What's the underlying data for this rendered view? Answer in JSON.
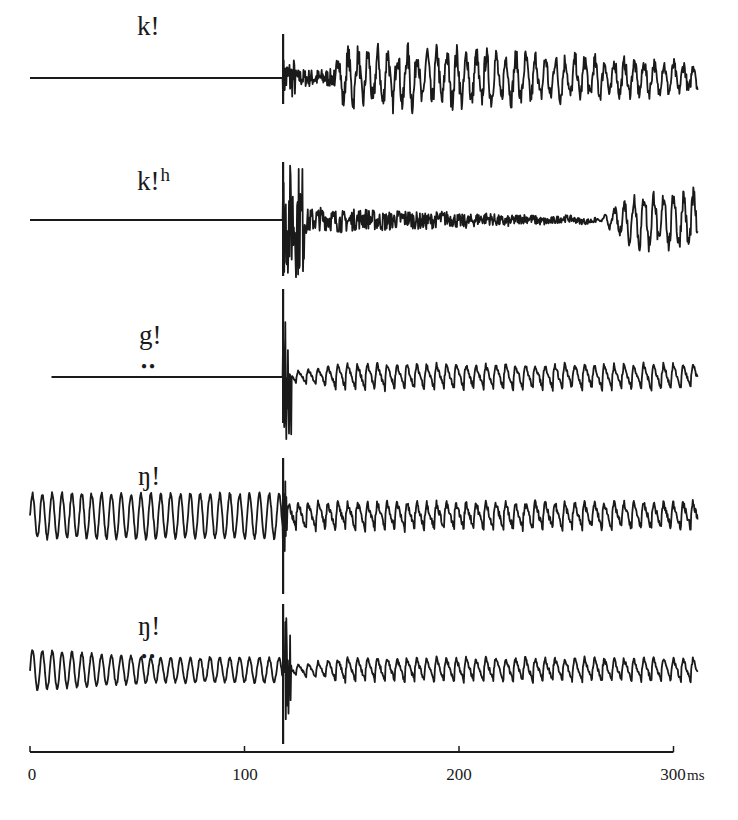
{
  "chart_data": {
    "type": "line",
    "title": "",
    "xlabel": "ms",
    "ylabel": "",
    "xlim": [
      0,
      300
    ],
    "x_ticks": [
      0,
      100,
      200,
      300
    ],
    "x_tick_labels": [
      "0",
      "100",
      "200",
      "300"
    ],
    "x_unit": "ms",
    "grid": false,
    "legend": "none (each trace labeled above its left part)",
    "release_time_ms": 118,
    "series": [
      {
        "name": "k!",
        "label": "k!",
        "superscript": "",
        "breathy_dots": false,
        "baseline_y_px": 78,
        "segments": [
          {
            "from_ms": 0,
            "to_ms": 118,
            "kind": "silence"
          },
          {
            "from_ms": 118,
            "to_ms": 124,
            "kind": "release burst",
            "rel_amplitude": 0.8
          },
          {
            "from_ms": 124,
            "to_ms": 142,
            "kind": "low-amplitude noise",
            "rel_amplitude": 0.25
          },
          {
            "from_ms": 142,
            "to_ms": 310,
            "kind": "modal voicing (vowel)",
            "rel_amplitude": 1.0,
            "peak_near_ms": 175
          }
        ]
      },
      {
        "name": "k!h",
        "label": "k!",
        "superscript": "h",
        "breathy_dots": false,
        "baseline_y_px": 220,
        "segments": [
          {
            "from_ms": 0,
            "to_ms": 118,
            "kind": "silence"
          },
          {
            "from_ms": 118,
            "to_ms": 128,
            "kind": "release burst",
            "rel_amplitude": 1.0
          },
          {
            "from_ms": 128,
            "to_ms": 265,
            "kind": "aspiration noise",
            "rel_amplitude": 0.08
          },
          {
            "from_ms": 265,
            "to_ms": 310,
            "kind": "voicing onset (vowel)",
            "rel_amplitude": 0.7
          }
        ]
      },
      {
        "name": "g!",
        "label": "g!",
        "superscript": "",
        "breathy_dots": true,
        "baseline_y_px": 377,
        "segments": [
          {
            "from_ms": 10,
            "to_ms": 118,
            "kind": "silence"
          },
          {
            "from_ms": 118,
            "to_ms": 122,
            "kind": "release burst",
            "rel_amplitude": 1.0
          },
          {
            "from_ms": 122,
            "to_ms": 310,
            "kind": "breathy voicing (vowel)",
            "rel_amplitude": 0.45
          }
        ]
      },
      {
        "name": "ŋ!",
        "label": "ŋ!",
        "superscript": "",
        "breathy_dots": false,
        "baseline_y_px": 516,
        "segments": [
          {
            "from_ms": 0,
            "to_ms": 118,
            "kind": "nasal voicing",
            "rel_amplitude": 0.5
          },
          {
            "from_ms": 118,
            "to_ms": 120,
            "kind": "release burst",
            "rel_amplitude": 1.0
          },
          {
            "from_ms": 120,
            "to_ms": 310,
            "kind": "modal voicing (vowel)",
            "rel_amplitude": 0.4
          }
        ]
      },
      {
        "name": "ŋ̤!",
        "label": "ŋ!",
        "superscript": "",
        "breathy_dots": true,
        "baseline_y_px": 670,
        "segments": [
          {
            "from_ms": 0,
            "to_ms": 118,
            "kind": "breathy nasal voicing, decaying",
            "rel_amplitude": 0.45
          },
          {
            "from_ms": 118,
            "to_ms": 122,
            "kind": "release burst",
            "rel_amplitude": 1.0
          },
          {
            "from_ms": 122,
            "to_ms": 310,
            "kind": "breathy voicing (vowel)",
            "rel_amplitude": 0.35
          }
        ]
      }
    ]
  },
  "labels": {
    "k": {
      "base": "k!",
      "sup": ""
    },
    "kh": {
      "base": "k!",
      "sup": "h"
    },
    "g": {
      "base": "g!",
      "sup": ""
    },
    "ng": {
      "base": "ŋ!",
      "sup": ""
    },
    "ngb": {
      "base": "ŋ!",
      "sup": ""
    }
  },
  "axis": {
    "ticks": [
      "0",
      "100",
      "200",
      "300"
    ],
    "unit": "ms"
  },
  "colors": {
    "ink": "#1a1a1a",
    "background": "#ffffff"
  }
}
